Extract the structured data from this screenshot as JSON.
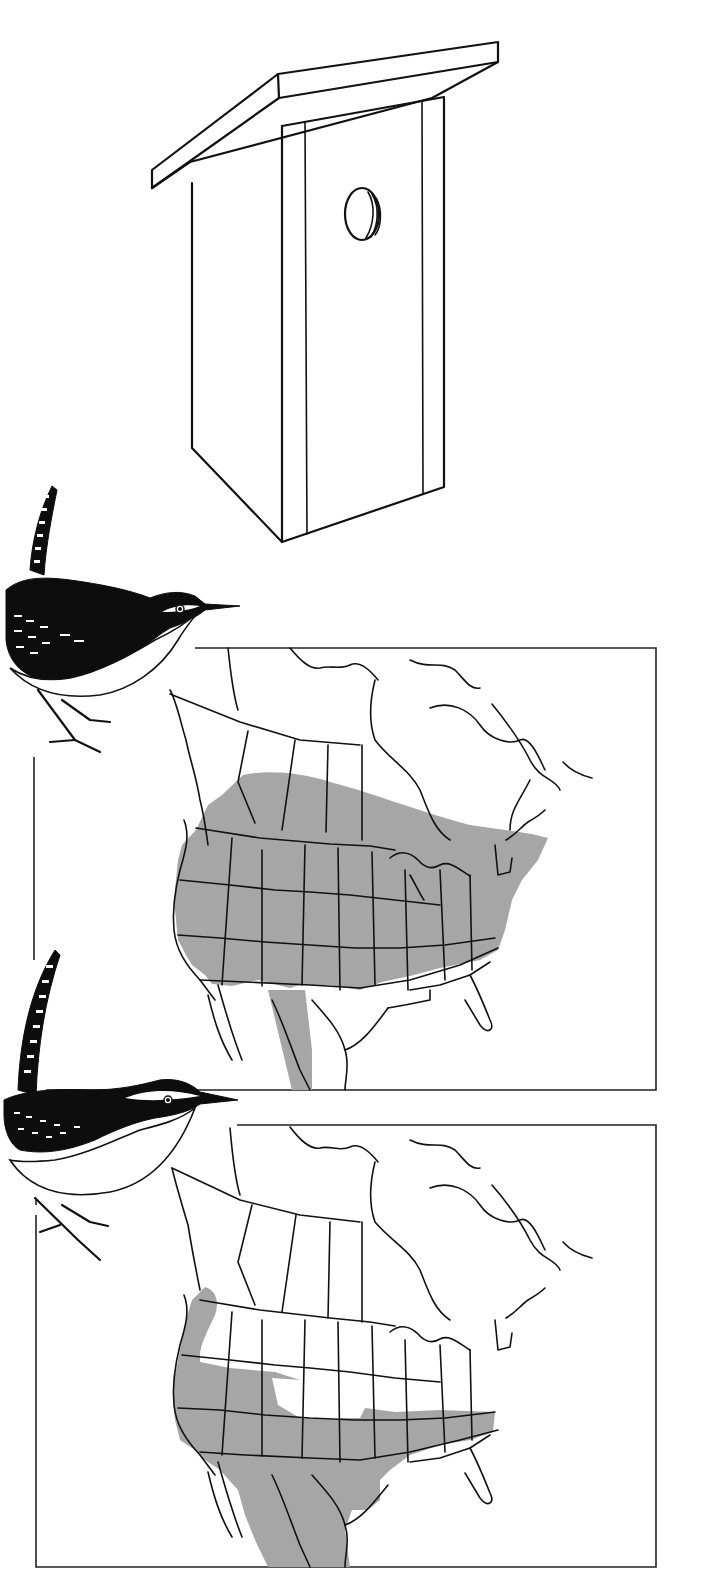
{
  "illustration": {
    "type": "field-guide plate",
    "background_color": "#ffffff",
    "ink_color": "#111111",
    "range_shade_color": "#a6a6a6"
  },
  "birdhouse": {
    "icon": "birdhouse-icon",
    "features": [
      "slanted roof",
      "front board with entrance hole",
      "side panel",
      "vertical trim strips"
    ]
  },
  "species": [
    {
      "id": "wren-1",
      "icon": "wren-icon",
      "range_map": {
        "icon": "north-america-map-icon",
        "shaded_region": "Southern Canada, most of contiguous US except the Southeast and Gulf coast, with extension into central Mexico"
      }
    },
    {
      "id": "wren-2",
      "icon": "wren-icon",
      "range_map": {
        "icon": "north-america-map-icon",
        "shaded_region": "Pacific coast from British Columbia, Southwest US, southern Plains to Appalachians, and northern Mexico"
      }
    }
  ]
}
